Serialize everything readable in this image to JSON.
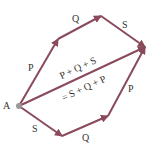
{
  "diagram": {
    "colors": {
      "arrow": "#8a4a5c",
      "text": "#333333",
      "point": "#999999"
    },
    "point_label": "A",
    "top_path": [
      {
        "label": "P"
      },
      {
        "label": "Q"
      },
      {
        "label": "S"
      }
    ],
    "bottom_path": [
      {
        "label": "S"
      },
      {
        "label": "Q"
      },
      {
        "label": "P"
      }
    ],
    "resultant": {
      "line1": "P + Q + S",
      "line2": "= S + Q + P"
    }
  }
}
